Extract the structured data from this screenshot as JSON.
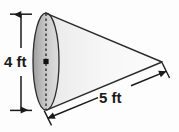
{
  "figure": {
    "name": "cone-diagram",
    "shape": "cone",
    "background_color": "#fdfdfd",
    "outline_color": "#2b2b2b",
    "body_fill_light": "#fdfdfd",
    "body_fill_mid": "#e8e8e8",
    "base_fill_dark": "#a8a8a8",
    "base_fill_light": "#d8d8d8",
    "labels": {
      "height": "4 ft",
      "slant": "5 ft"
    },
    "dimensions": [
      {
        "id": "height-dimension",
        "label": "4 ft",
        "value": 4,
        "unit": "ft",
        "measures": "diameter-of-base",
        "orientation": "vertical",
        "position": "left"
      },
      {
        "id": "slant-dimension",
        "label": "5 ft",
        "value": 5,
        "unit": "ft",
        "measures": "slant-height",
        "orientation": "diagonal",
        "position": "bottom-right"
      }
    ],
    "base_ellipse": {
      "center_x": 46,
      "center_y": 61.5,
      "radius_x": 13,
      "radius_y": 48.5
    },
    "apex": {
      "x": 162,
      "y": 62
    }
  }
}
